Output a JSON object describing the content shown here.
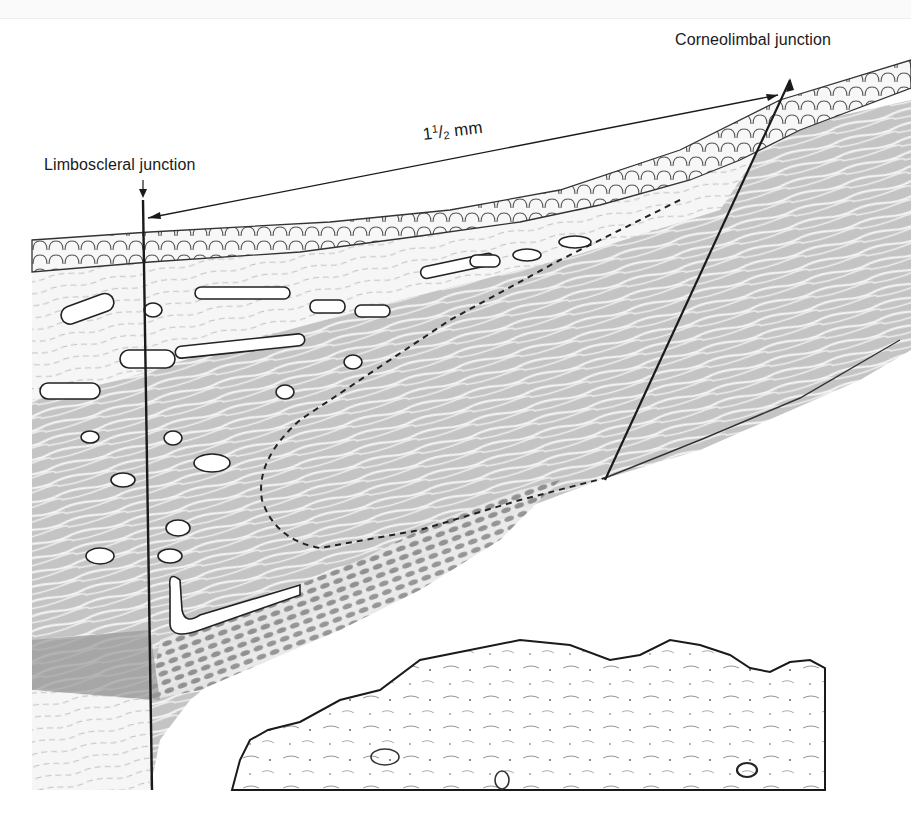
{
  "figure": {
    "labels": {
      "corneolimbal": "Corneolimbal junction",
      "limboscleral": "Limboscleral junction",
      "scale_whole": "1",
      "scale_num": "1",
      "scale_den": "2",
      "scale_unit": "mm"
    },
    "colors": {
      "ink": "#1a1a1a",
      "stroma": "#c9c9c9",
      "stroma_dark": "#9e9e9e",
      "background": "#ffffff"
    }
  }
}
